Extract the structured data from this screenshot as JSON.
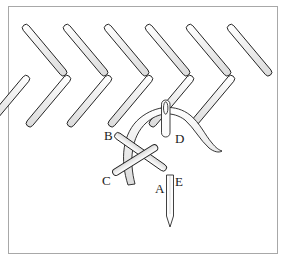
{
  "figure": {
    "border_color": "#a8a8a8",
    "background_color": "#ffffff",
    "thread_fill": "#eeeeee",
    "thread_outline": "#1a1a1a",
    "needle_fill": "#fafafa",
    "needle_outline": "#2a2a2a"
  },
  "stitch_row": {
    "name": "cross-stitch-row",
    "crosses": 6,
    "left": 22,
    "right": 268,
    "top": 28,
    "bottom": 80,
    "thread_width": 7
  },
  "detail": {
    "name": "needle-thread-detail",
    "labels": [
      {
        "id": "B",
        "text": "B",
        "x": 104,
        "y": 129
      },
      {
        "id": "D",
        "text": "D",
        "x": 175,
        "y": 132
      },
      {
        "id": "C",
        "text": "C",
        "x": 102,
        "y": 174
      },
      {
        "id": "A",
        "text": "A",
        "x": 155,
        "y": 182
      },
      {
        "id": "E",
        "text": "E",
        "x": 175,
        "y": 175
      }
    ]
  }
}
